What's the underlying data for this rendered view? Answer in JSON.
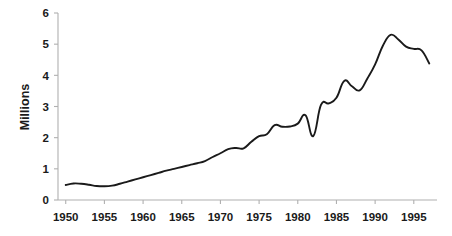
{
  "chart_data": {
    "type": "line",
    "title": "",
    "subtitle": "",
    "xlabel": "",
    "ylabel": "Millions",
    "xlim": [
      1949.0,
      1998.0
    ],
    "ylim": [
      0,
      6
    ],
    "ytick_labels": [
      "0",
      "1",
      "2",
      "3",
      "4",
      "5",
      "6"
    ],
    "ytick_values": [
      0,
      1,
      2,
      3,
      4,
      5,
      6
    ],
    "xtick_labels": [
      "1950",
      "1955",
      "1960",
      "1965",
      "1970",
      "1975",
      "1980",
      "1985",
      "1990",
      "1995"
    ],
    "xtick_values": [
      1950,
      1955,
      1960,
      1965,
      1970,
      1975,
      1980,
      1985,
      1990,
      1995
    ],
    "grid": false,
    "legend": null,
    "legend_position": "none",
    "annotations": [],
    "line_color": "#1a1a1a",
    "axis_color": "#b0b0b0",
    "background_color": "#ffffff",
    "series": [
      {
        "name": "Millions",
        "x": [
          1950,
          1951,
          1952,
          1953,
          1954,
          1955,
          1956,
          1957,
          1958,
          1959,
          1960,
          1961,
          1962,
          1963,
          1964,
          1965,
          1966,
          1967,
          1968,
          1969,
          1970,
          1971,
          1972,
          1973,
          1974,
          1975,
          1976,
          1977,
          1978,
          1979,
          1980,
          1981,
          1982,
          1983,
          1984,
          1985,
          1986,
          1987,
          1988,
          1989,
          1990,
          1991,
          1992,
          1993,
          1994,
          1995,
          1996,
          1997
        ],
        "values": [
          0.48,
          0.53,
          0.52,
          0.49,
          0.45,
          0.44,
          0.46,
          0.52,
          0.59,
          0.66,
          0.73,
          0.8,
          0.87,
          0.94,
          1.0,
          1.06,
          1.12,
          1.18,
          1.25,
          1.38,
          1.5,
          1.63,
          1.67,
          1.66,
          1.87,
          2.05,
          2.11,
          2.4,
          2.35,
          2.36,
          2.45,
          2.72,
          2.05,
          3.05,
          3.1,
          3.28,
          3.82,
          3.65,
          3.52,
          3.9,
          4.35,
          4.95,
          5.3,
          5.15,
          4.92,
          4.85,
          4.8,
          4.38
        ]
      }
    ]
  },
  "axis": {
    "y_title": "Millions"
  }
}
